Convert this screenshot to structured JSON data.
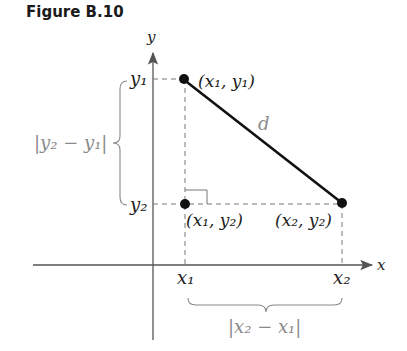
{
  "figure": {
    "title": "Figure B.10"
  },
  "axes": {
    "x_label": "x",
    "y_label": "y"
  },
  "points": [
    {
      "name": "P1",
      "label": "(x₁, y₁)",
      "x": 183,
      "y": 79
    },
    {
      "name": "P2",
      "label": "(x₂, y₂)",
      "x": 342,
      "y": 203
    },
    {
      "name": "P3",
      "label": "(x₁, y₂)",
      "x": 185,
      "y": 204
    }
  ],
  "segment_label": "d",
  "tick_labels": {
    "y1": "y₁",
    "y2": "y₂",
    "x1": "x₁",
    "x2": "x₂"
  },
  "brace_labels": {
    "vertical": "|y₂ − y₁|",
    "horizontal": "|x₂ − x₁|"
  },
  "colors": {
    "line": "#111111",
    "axis": "#555555",
    "dashed": "#777777",
    "gray_text": "#8a8a8a"
  }
}
